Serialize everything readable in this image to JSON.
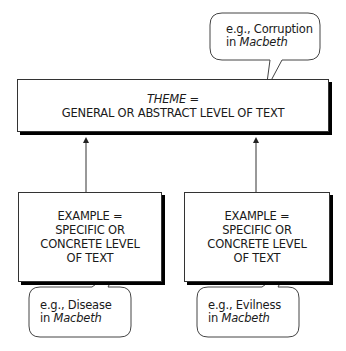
{
  "theme_box": {
    "title": "THEME =",
    "subtitle": "GENERAL OR ABSTRACT LEVEL OF TEXT"
  },
  "example_boxes": [
    {
      "line1": "EXAMPLE =",
      "line2": "SPECIFIC OR",
      "line3": "CONCRETE LEVEL",
      "line4": "OF TEXT"
    },
    {
      "line1": "EXAMPLE =",
      "line2": "SPECIFIC OR",
      "line3": "CONCRETE LEVEL",
      "line4": "OF TEXT"
    }
  ],
  "bubbles": {
    "theme": {
      "prefix": "e.g., Corruption",
      "in": "in ",
      "work": "Macbeth"
    },
    "example_left": {
      "prefix": "e.g., Disease",
      "in": "in ",
      "work": "Macbeth"
    },
    "example_right": {
      "prefix": "e.g., Evilness",
      "in": "in ",
      "work": "Macbeth"
    }
  },
  "colors": {
    "stroke": "#333333",
    "shadow": "#000000",
    "background": "#ffffff"
  }
}
